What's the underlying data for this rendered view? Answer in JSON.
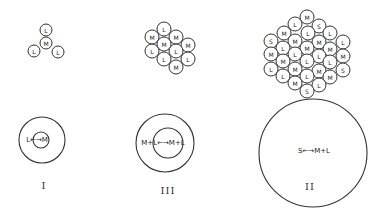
{
  "figure": {
    "panels": [
      {
        "id": "I",
        "label": "I",
        "cluster": {
          "radius": 6,
          "nodes": [
            {
              "x": 46,
              "y": 30,
              "t": "L"
            },
            {
              "x": 46,
              "y": 43,
              "t": "M"
            },
            {
              "x": 34,
              "y": 51,
              "t": "L"
            },
            {
              "x": 58,
              "y": 52,
              "t": "L"
            }
          ]
        },
        "rings": {
          "cx": 42,
          "cy": 140,
          "outer_r": 23,
          "inner_cx": 41,
          "inner_cy": 140,
          "inner_r": 8
        },
        "equilibrium": "L←→M",
        "equilibrium_pos": {
          "x": 37,
          "y": 140
        },
        "label_pos": {
          "x": 44,
          "y": 185
        }
      },
      {
        "id": "III",
        "label": "III",
        "cluster": {
          "radius": 7,
          "nodes": [
            {
              "x": 164,
              "y": 29,
              "t": "L"
            },
            {
              "x": 152,
              "y": 37,
              "t": "M"
            },
            {
              "x": 176,
              "y": 37,
              "t": "M"
            },
            {
              "x": 164,
              "y": 44,
              "t": "M"
            },
            {
              "x": 188,
              "y": 45,
              "t": "M"
            },
            {
              "x": 152,
              "y": 51,
              "t": "L"
            },
            {
              "x": 176,
              "y": 51,
              "t": "L"
            },
            {
              "x": 164,
              "y": 59,
              "t": "L"
            },
            {
              "x": 188,
              "y": 59,
              "t": "L"
            },
            {
              "x": 176,
              "y": 67,
              "t": "M"
            }
          ]
        },
        "rings": {
          "cx": 165,
          "cy": 143,
          "outer_r": 29,
          "inner_cx": 168,
          "inner_cy": 143,
          "inner_r": 15
        },
        "equilibrium": "M+L←→M+L",
        "equilibrium_pos": {
          "x": 163,
          "y": 143
        },
        "label_pos": {
          "x": 168,
          "y": 190
        }
      },
      {
        "id": "II",
        "label": "II",
        "cluster": {
          "radius": 7,
          "nodes": [
            {
              "x": 307,
              "y": 17,
              "t": "M"
            },
            {
              "x": 295,
              "y": 24,
              "t": "L"
            },
            {
              "x": 319,
              "y": 26,
              "t": "S"
            },
            {
              "x": 284,
              "y": 33,
              "t": "M"
            },
            {
              "x": 308,
              "y": 33,
              "t": "L"
            },
            {
              "x": 330,
              "y": 33,
              "t": "L"
            },
            {
              "x": 271,
              "y": 41,
              "t": "S"
            },
            {
              "x": 295,
              "y": 41,
              "t": "M"
            },
            {
              "x": 319,
              "y": 42,
              "t": "M"
            },
            {
              "x": 343,
              "y": 42,
              "t": "L"
            },
            {
              "x": 283,
              "y": 48,
              "t": "L"
            },
            {
              "x": 307,
              "y": 48,
              "t": "M"
            },
            {
              "x": 330,
              "y": 49,
              "t": "M"
            },
            {
              "x": 271,
              "y": 54,
              "t": "M"
            },
            {
              "x": 295,
              "y": 54,
              "t": "L"
            },
            {
              "x": 319,
              "y": 56,
              "t": "L"
            },
            {
              "x": 343,
              "y": 56,
              "t": "M"
            },
            {
              "x": 283,
              "y": 61,
              "t": "M"
            },
            {
              "x": 307,
              "y": 61,
              "t": "L"
            },
            {
              "x": 330,
              "y": 62,
              "t": "L"
            },
            {
              "x": 271,
              "y": 69,
              "t": "L"
            },
            {
              "x": 295,
              "y": 69,
              "t": "M"
            },
            {
              "x": 319,
              "y": 71,
              "t": "M"
            },
            {
              "x": 343,
              "y": 70,
              "t": "S"
            },
            {
              "x": 283,
              "y": 76,
              "t": "L"
            },
            {
              "x": 307,
              "y": 76,
              "t": "L"
            },
            {
              "x": 330,
              "y": 77,
              "t": "M"
            },
            {
              "x": 295,
              "y": 83,
              "t": "M"
            },
            {
              "x": 319,
              "y": 85,
              "t": "L"
            },
            {
              "x": 307,
              "y": 91,
              "t": "S"
            }
          ]
        },
        "rings": {
          "cx": 313,
          "cy": 153,
          "outer_r": 54
        },
        "equilibrium": "S←→M+L",
        "equilibrium_pos": {
          "x": 314,
          "y": 151
        },
        "label_pos": {
          "x": 310,
          "y": 186
        }
      }
    ]
  }
}
